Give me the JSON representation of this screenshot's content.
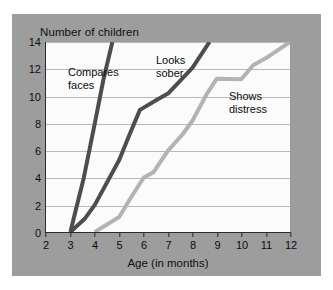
{
  "chart_data": {
    "type": "line",
    "title": "Number of children",
    "xlabel": "Age (in months)",
    "ylabel": "Number of children",
    "xlim": [
      2,
      12
    ],
    "ylim": [
      0,
      14
    ],
    "xticks": [
      2,
      3,
      4,
      5,
      6,
      7,
      8,
      9,
      10,
      11,
      12
    ],
    "yticks": [
      0,
      2,
      4,
      6,
      8,
      10,
      12,
      14
    ],
    "grid": "horizontal",
    "legend": "inline-annotations",
    "series": [
      {
        "name": "Compares faces",
        "color": "#4d4d4d",
        "points": [
          [
            3,
            0
          ],
          [
            3.15,
            1.1
          ],
          [
            3.55,
            4.0
          ],
          [
            4.0,
            8.0
          ],
          [
            4.35,
            11.2
          ],
          [
            4.72,
            14.0
          ]
        ]
      },
      {
        "name": "Looks sober",
        "color": "#4d4d4d",
        "points": [
          [
            3,
            0
          ],
          [
            3.6,
            1.0
          ],
          [
            4.0,
            2.0
          ],
          [
            5.0,
            5.3
          ],
          [
            5.45,
            7.3
          ],
          [
            5.85,
            9.0
          ],
          [
            6.6,
            9.8
          ],
          [
            7.0,
            10.2
          ],
          [
            8.0,
            12.1
          ],
          [
            8.7,
            14.0
          ]
        ]
      },
      {
        "name": "Shows distress",
        "color": "#b3b3b3",
        "points": [
          [
            4,
            0
          ],
          [
            4.5,
            0.55
          ],
          [
            5.0,
            1.1
          ],
          [
            5.5,
            2.6
          ],
          [
            6.0,
            4.0
          ],
          [
            6.4,
            4.4
          ],
          [
            7.0,
            6.0
          ],
          [
            7.6,
            7.2
          ],
          [
            8.0,
            8.2
          ],
          [
            8.6,
            10.2
          ],
          [
            9.0,
            11.3
          ],
          [
            10.0,
            11.25
          ],
          [
            10.5,
            12.3
          ],
          [
            11.0,
            12.8
          ],
          [
            12.0,
            14.0
          ]
        ]
      }
    ]
  },
  "annotations": [
    {
      "id": "compares",
      "text": "Compares\nfaces"
    },
    {
      "id": "looks",
      "text": "Looks\nsober"
    },
    {
      "id": "shows",
      "text": "Shows\ndistress"
    }
  ],
  "colors": {
    "panel_background": "#9d9d9d",
    "plot_background": "#fbfbfb",
    "axis": "#2b2b2b",
    "gridline": "#b9b9b9",
    "dark_series": "#4d4d4d",
    "light_series": "#b3b3b3"
  }
}
